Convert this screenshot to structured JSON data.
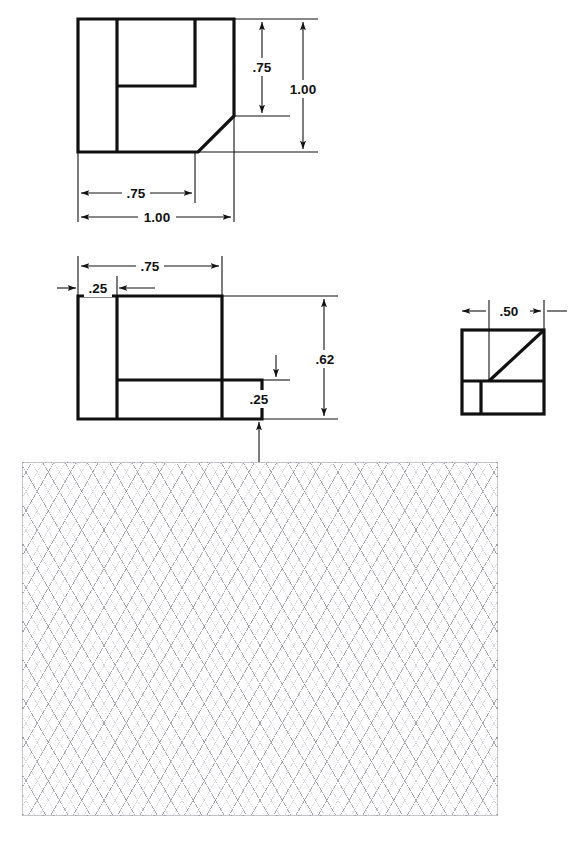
{
  "document": {
    "type": "orthographic-multiview-engineering-drawing",
    "sheet_width": 582,
    "sheet_height": 841,
    "background_color": "#ffffff",
    "line_color": "#111111",
    "grid_color": "#8c8c94"
  },
  "views": {
    "top": {
      "name": "top-view",
      "label": "",
      "dimensions": {
        "overall_width": "1.00",
        "partial_width": ".75",
        "overall_depth": "1.00",
        "partial_depth": ".75"
      }
    },
    "front": {
      "name": "front-view",
      "label": "",
      "dimensions": {
        "partial_width": ".75",
        "left_rib_width": ".25",
        "overall_height": ".62",
        "base_height": ".25"
      }
    },
    "right": {
      "name": "right-side-view",
      "label": "",
      "dimensions": {
        "chamfer_width": ".50"
      }
    }
  },
  "dimension_labels": {
    "top_vertical_inner": ".75",
    "top_vertical_outer": "1.00",
    "top_horizontal_inner": ".75",
    "top_horizontal_outer": "1.00",
    "front_horizontal_outer": ".75",
    "front_horizontal_inner": ".25",
    "front_vertical_outer": ".62",
    "front_vertical_inner": ".25",
    "right_horizontal": ".50"
  },
  "grid": {
    "name": "isometric-grid-paper",
    "style": "isometric-diamond-lattice",
    "x": 22,
    "y": 462,
    "width": 476,
    "height": 354
  }
}
